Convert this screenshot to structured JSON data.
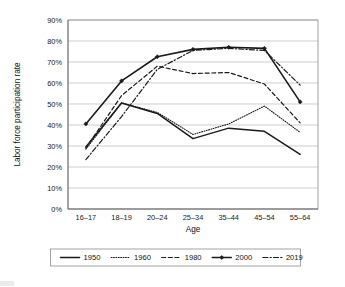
{
  "chart_data": {
    "type": "line",
    "title": "",
    "xlabel": "Age",
    "ylabel": "Labor force participation rate",
    "categories": [
      "16–17",
      "18–19",
      "20–24",
      "25–34",
      "35–44",
      "45–54",
      "55–64"
    ],
    "ylim": [
      0,
      90
    ],
    "ytick_labels": [
      "0%",
      "10%",
      "20%",
      "30%",
      "40%",
      "50%",
      "60%",
      "70%",
      "80%",
      "90%"
    ],
    "ytick_values": [
      0,
      10,
      20,
      30,
      40,
      50,
      60,
      70,
      80,
      90
    ],
    "grid": true,
    "legend_position": "bottom",
    "series": [
      {
        "name": "1950",
        "style": "solid",
        "markers": false,
        "values": [
          29.5,
          50.5,
          45.5,
          33.5,
          38.5,
          37.0,
          26.0
        ]
      },
      {
        "name": "1960",
        "style": "dotted",
        "markers": false,
        "values": [
          28.5,
          50.5,
          46.0,
          35.5,
          40.5,
          49.0,
          36.5
        ]
      },
      {
        "name": "1980",
        "style": "dashed",
        "markers": false,
        "values": [
          29.0,
          54.0,
          68.0,
          64.5,
          65.0,
          59.5,
          41.0
        ]
      },
      {
        "name": "2000",
        "style": "solid-markers",
        "markers": true,
        "values": [
          40.5,
          61.0,
          72.5,
          76.0,
          77.0,
          76.5,
          51.0
        ]
      },
      {
        "name": "2019",
        "style": "dash-dot",
        "markers": false,
        "values": [
          23.5,
          44.0,
          66.5,
          75.5,
          76.5,
          75.5,
          59.0
        ]
      }
    ]
  }
}
